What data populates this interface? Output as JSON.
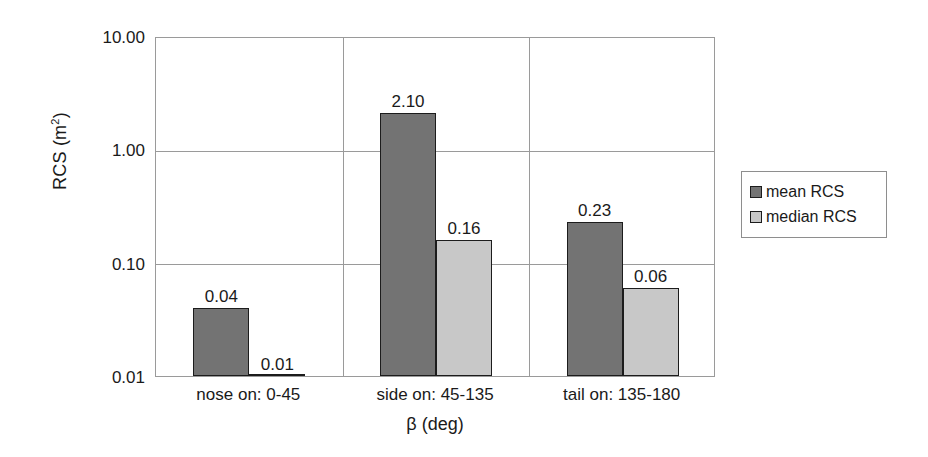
{
  "chart_data": {
    "type": "bar",
    "title": "",
    "xlabel": "β (deg)",
    "ylabel": "RCS (m2)",
    "ylabel_base": "RCS (m",
    "ylabel_sup": "2",
    "ylabel_tail": ")",
    "yscale": "log",
    "ylim": [
      0.01,
      10.0
    ],
    "ytick_labels": [
      "10.00",
      "1.00",
      "0.10",
      "0.01"
    ],
    "ytick_values": [
      10.0,
      1.0,
      0.1,
      0.01
    ],
    "grid": "horizontal gridlines at decades; vertical separators between categories",
    "legend_position": "right outside plot",
    "categories": [
      "nose on:  0-45",
      "side on: 45-135",
      "tail on: 135-180"
    ],
    "series": [
      {
        "name": "mean RCS",
        "color": "#737373",
        "values": [
          0.04,
          2.1,
          0.23
        ],
        "labels": [
          "0.04",
          "2.10",
          "0.23"
        ]
      },
      {
        "name": "median RCS",
        "color": "#c8c8c8",
        "values": [
          0.01,
          0.16,
          0.06
        ],
        "labels": [
          "0.01",
          "0.16",
          "0.06"
        ]
      }
    ]
  },
  "legend": {
    "items": [
      {
        "label": "mean RCS",
        "color": "#737373"
      },
      {
        "label": "median RCS",
        "color": "#c8c8c8"
      }
    ]
  },
  "colors": {
    "bar_dark": "#737373",
    "bar_light": "#c8c8c8",
    "bar_outline": "#1c1c1c",
    "gridline": "#9a9a9a",
    "text": "#1a1a1a",
    "background": "#ffffff"
  }
}
